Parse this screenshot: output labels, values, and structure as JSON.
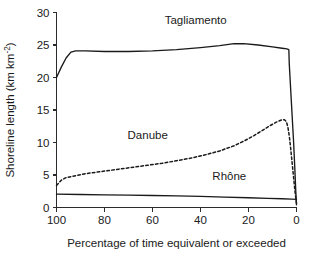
{
  "chart_data": {
    "type": "line",
    "title": "",
    "xlabel": "Percentage of time equivalent or exceeded",
    "ylabel": "Shoreline length (km km",
    "ylabel_sup": "-2",
    "ylabel_tail": ")",
    "xlim": [
      100,
      0
    ],
    "ylim": [
      0,
      30
    ],
    "xticks": [
      100,
      80,
      60,
      40,
      20,
      0
    ],
    "xticklabels": [
      "100",
      "80",
      "60",
      "40",
      "20",
      "0"
    ],
    "yticks": [
      0,
      5,
      10,
      15,
      20,
      25,
      30
    ],
    "yticklabels": [
      "0",
      "5",
      "10",
      "15",
      "20",
      "25",
      "30"
    ],
    "grid": false,
    "legend_position": "inline-annotations",
    "x_axis_inverted": true,
    "series": [
      {
        "name": "Tagliamento",
        "style": "solid",
        "color": "#1a1a1a",
        "label_x": 42,
        "label_y": 28.2,
        "points": [
          [
            100,
            20.0
          ],
          [
            98,
            21.6
          ],
          [
            96,
            23.0
          ],
          [
            94,
            23.9
          ],
          [
            92,
            24.1
          ],
          [
            88,
            24.1
          ],
          [
            80,
            24.0
          ],
          [
            70,
            24.0
          ],
          [
            60,
            24.1
          ],
          [
            50,
            24.3
          ],
          [
            40,
            24.6
          ],
          [
            32,
            24.9
          ],
          [
            26,
            25.2
          ],
          [
            22,
            25.2
          ],
          [
            16,
            25.0
          ],
          [
            10,
            24.7
          ],
          [
            6,
            24.5
          ],
          [
            4,
            24.4
          ],
          [
            3.2,
            24.3
          ],
          [
            3.0,
            22.0
          ],
          [
            2.4,
            18.0
          ],
          [
            1.8,
            14.0
          ],
          [
            1.2,
            10.0
          ],
          [
            0.7,
            6.0
          ],
          [
            0.3,
            2.5
          ],
          [
            0.0,
            0.4
          ]
        ]
      },
      {
        "name": "Danube",
        "style": "dashed",
        "color": "#1a1a1a",
        "label_x": 62,
        "label_y": 10.6,
        "points": [
          [
            100,
            3.4
          ],
          [
            98,
            4.2
          ],
          [
            96,
            4.6
          ],
          [
            92,
            4.9
          ],
          [
            88,
            5.2
          ],
          [
            84,
            5.4
          ],
          [
            80,
            5.6
          ],
          [
            74,
            5.9
          ],
          [
            68,
            6.2
          ],
          [
            62,
            6.5
          ],
          [
            56,
            6.8
          ],
          [
            50,
            7.2
          ],
          [
            44,
            7.6
          ],
          [
            38,
            8.1
          ],
          [
            32,
            8.7
          ],
          [
            26,
            9.5
          ],
          [
            22,
            10.2
          ],
          [
            18,
            11.0
          ],
          [
            14,
            11.9
          ],
          [
            11,
            12.6
          ],
          [
            8,
            13.2
          ],
          [
            6,
            13.5
          ],
          [
            5,
            13.5
          ],
          [
            4.2,
            13.2
          ],
          [
            3.6,
            12.4
          ],
          [
            3.0,
            11.0
          ],
          [
            2.4,
            9.0
          ],
          [
            1.8,
            6.8
          ],
          [
            1.2,
            4.6
          ],
          [
            0.6,
            2.4
          ],
          [
            0.0,
            0.6
          ]
        ]
      },
      {
        "name": "Rhône",
        "style": "solid",
        "color": "#1a1a1a",
        "label_x": 28,
        "label_y": 4.2,
        "points": [
          [
            100,
            2.05
          ],
          [
            90,
            2.0
          ],
          [
            80,
            1.95
          ],
          [
            70,
            1.9
          ],
          [
            60,
            1.85
          ],
          [
            50,
            1.8
          ],
          [
            40,
            1.7
          ],
          [
            30,
            1.6
          ],
          [
            20,
            1.5
          ],
          [
            12,
            1.4
          ],
          [
            6,
            1.35
          ],
          [
            2,
            1.3
          ],
          [
            0,
            1.25
          ]
        ]
      }
    ]
  }
}
